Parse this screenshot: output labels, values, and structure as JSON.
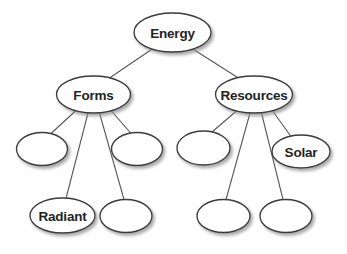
{
  "diagram": {
    "background_color": "#ffffff",
    "node_fill_color": "#ffffff",
    "node_stroke_color": "#3a3a3c",
    "edge_stroke_color": "#58585a",
    "label_color": "#242424",
    "nodes": [
      {
        "id": "energy",
        "label": "Energy",
        "cx": 172.5,
        "cy": 32.5,
        "rx": 38.5,
        "ry": 19.5,
        "level": 0,
        "labeled": true
      },
      {
        "id": "forms",
        "label": "Forms",
        "cx": 93.5,
        "cy": 94.5,
        "rx": 37.0,
        "ry": 18.5,
        "level": 1,
        "labeled": true
      },
      {
        "id": "resources",
        "label": "Resources",
        "cx": 254.0,
        "cy": 94.5,
        "rx": 38.5,
        "ry": 18.5,
        "level": 1,
        "labeled": true
      },
      {
        "id": "forms-child-1",
        "label": "",
        "cx": 42.0,
        "cy": 149.0,
        "rx": 25.5,
        "ry": 16.5,
        "level": 2,
        "labeled": false
      },
      {
        "id": "forms-child-2",
        "label": "",
        "cx": 137.0,
        "cy": 149.0,
        "rx": 25.5,
        "ry": 16.5,
        "level": 2,
        "labeled": false
      },
      {
        "id": "forms-child-3",
        "label": "Radiant",
        "cx": 62.5,
        "cy": 215.5,
        "rx": 32.5,
        "ry": 17.5,
        "level": 3,
        "labeled": true
      },
      {
        "id": "forms-child-4",
        "label": "",
        "cx": 126.0,
        "cy": 216.0,
        "rx": 26.0,
        "ry": 16.5,
        "level": 3,
        "labeled": false
      },
      {
        "id": "resources-child-1",
        "label": "",
        "cx": 203.5,
        "cy": 148.0,
        "rx": 26.5,
        "ry": 17.0,
        "level": 2,
        "labeled": false
      },
      {
        "id": "resources-child-2",
        "label": "Solar",
        "cx": 301.0,
        "cy": 151.5,
        "rx": 29.0,
        "ry": 16.5,
        "level": 2,
        "labeled": true
      },
      {
        "id": "resources-child-3",
        "label": "",
        "cx": 223.5,
        "cy": 216.0,
        "rx": 26.5,
        "ry": 16.5,
        "level": 3,
        "labeled": false
      },
      {
        "id": "resources-child-4",
        "label": "",
        "cx": 286.0,
        "cy": 216.0,
        "rx": 26.0,
        "ry": 16.5,
        "level": 3,
        "labeled": false
      }
    ],
    "edges": [
      {
        "id": "edge-energy-forms",
        "from": "energy",
        "to": "forms",
        "x1": 153.0,
        "y1": 48.5,
        "x2": 108.0,
        "y2": 79.0
      },
      {
        "id": "edge-energy-resources",
        "from": "energy",
        "to": "resources",
        "x1": 192.0,
        "y1": 48.5,
        "x2": 240.0,
        "y2": 79.0
      },
      {
        "id": "edge-forms-child1",
        "from": "forms",
        "to": "forms-child-1",
        "x1": 76.0,
        "y1": 110.5,
        "x2": 51.0,
        "y2": 133.5
      },
      {
        "id": "edge-forms-child2",
        "from": "forms",
        "to": "forms-child-2",
        "x1": 111.0,
        "y1": 110.5,
        "x2": 131.0,
        "y2": 133.5
      },
      {
        "id": "edge-forms-child3",
        "from": "forms",
        "to": "forms-child-3",
        "x1": 88.0,
        "y1": 113.0,
        "x2": 66.0,
        "y2": 198.5
      },
      {
        "id": "edge-forms-child4",
        "from": "forms",
        "to": "forms-child-4",
        "x1": 99.5,
        "y1": 113.0,
        "x2": 124.0,
        "y2": 199.5
      },
      {
        "id": "edge-resources-child1",
        "from": "resources",
        "to": "resources-child-1",
        "x1": 237.0,
        "y1": 110.5,
        "x2": 212.0,
        "y2": 132.0
      },
      {
        "id": "edge-resources-child2",
        "from": "resources",
        "to": "resources-child-2",
        "x1": 272.0,
        "y1": 110.0,
        "x2": 291.0,
        "y2": 136.5
      },
      {
        "id": "edge-resources-child3",
        "from": "resources",
        "to": "resources-child-3",
        "x1": 250.0,
        "y1": 113.0,
        "x2": 226.0,
        "y2": 199.5
      },
      {
        "id": "edge-resources-child4",
        "from": "resources",
        "to": "resources-child-4",
        "x1": 261.5,
        "y1": 113.0,
        "x2": 283.0,
        "y2": 199.5
      }
    ]
  }
}
